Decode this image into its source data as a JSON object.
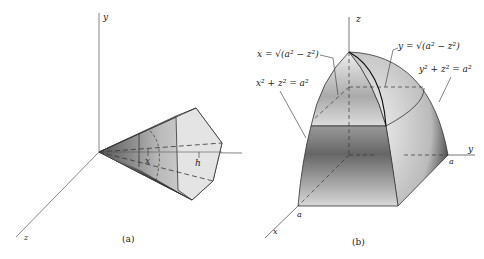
{
  "figure_a": {
    "caption": "(a)",
    "axes": {
      "y": "y",
      "x": "x",
      "z": "z"
    },
    "labels": {
      "x_var": "x",
      "h": "h"
    }
  },
  "figure_b": {
    "caption": "(b)",
    "axes": {
      "z": "z",
      "y": "y",
      "x": "x"
    },
    "labels": {
      "eq1": "x = √(a² − z²)",
      "eq2": "x² + z² = a²",
      "eq3": "y = √(a² − z²)",
      "eq4": "y² + z² = a²",
      "a_y": "a",
      "a_x": "a"
    }
  },
  "colors": {
    "line": "#333333",
    "shade_dark": "#2a2a2a",
    "shade_light": "#e8e8e8"
  }
}
